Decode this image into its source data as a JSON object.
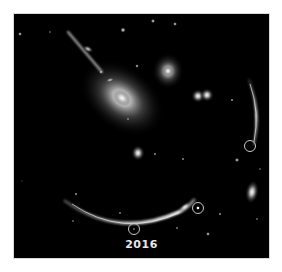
{
  "image": {
    "subject": "gravitationally lensed galaxy cluster with arcs and circled supernova images",
    "caption": "2016",
    "background_color": "#000000",
    "marker_color": "#c8c8c8",
    "marker_count": 3
  }
}
